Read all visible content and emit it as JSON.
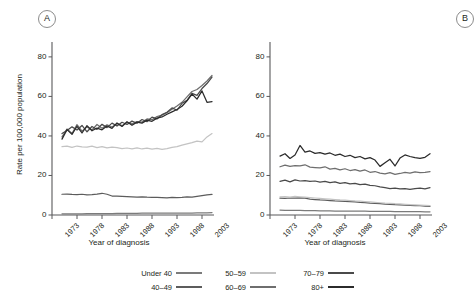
{
  "figure": {
    "panels": [
      {
        "tag": "A",
        "name": "panel-a"
      },
      {
        "tag": "B",
        "name": "panel-b"
      }
    ],
    "axis": {
      "ylabel": "Rate per 100,000 population",
      "xlabel": "Year of diagnosis",
      "yticks": [
        0,
        20,
        40,
        60,
        80
      ],
      "xticks": [
        1973,
        1978,
        1983,
        1988,
        1993,
        1998,
        2003
      ]
    }
  },
  "legend": {
    "entries": [
      {
        "label": "Under 40",
        "color": "#7b7b7b"
      },
      {
        "label": "40–49",
        "color": "#5c5c5c"
      },
      {
        "label": "50–59",
        "color": "#c3c3c3"
      },
      {
        "label": "60–69",
        "color": "#6e6e6e"
      },
      {
        "label": "70–79",
        "color": "#4a4a4a"
      },
      {
        "label": "80+",
        "color": "#2b2b2b"
      }
    ]
  },
  "chart_data": {
    "type": "line",
    "title": "",
    "xlabel": "Year of diagnosis",
    "ylabel": "Rate per 100,000 population",
    "xlim": [
      1973,
      2005
    ],
    "ylim": [
      0,
      85
    ],
    "yticks": [
      0,
      20,
      40,
      60,
      80
    ],
    "xticks": [
      1973,
      1978,
      1983,
      1988,
      1993,
      1998,
      2003
    ],
    "grid": false,
    "legend_position": "bottom",
    "panels": [
      {
        "tag": "A",
        "x": [
          1975,
          1976,
          1977,
          1978,
          1979,
          1980,
          1981,
          1982,
          1983,
          1984,
          1985,
          1986,
          1987,
          1988,
          1989,
          1990,
          1991,
          1992,
          1993,
          1994,
          1995,
          1996,
          1997,
          1998,
          1999,
          2000,
          2001,
          2002,
          2003,
          2004,
          2005
        ],
        "series": [
          {
            "name": "Under 40",
            "color": "#7b7b7b",
            "values": [
              0.6,
              0.6,
              0.6,
              0.6,
              0.6,
              0.7,
              0.7,
              0.7,
              0.7,
              0.7,
              0.7,
              0.8,
              0.8,
              0.8,
              0.8,
              0.8,
              0.9,
              0.9,
              0.9,
              0.9,
              0.9,
              1.0,
              1.0,
              1.0,
              1.0,
              1.0,
              1.0,
              1.1,
              1.1,
              1.1,
              1.2
            ]
          },
          {
            "name": "40–49",
            "color": "#5c5c5c",
            "values": [
              10.5,
              10.6,
              10.4,
              10.3,
              10.5,
              10.2,
              10.3,
              10.6,
              11.0,
              10.5,
              9.6,
              9.5,
              9.4,
              9.3,
              9.2,
              9.1,
              9.2,
              9.0,
              8.9,
              8.9,
              8.8,
              8.7,
              8.9,
              8.8,
              8.9,
              9.2,
              9.0,
              9.4,
              9.8,
              10.2,
              10.4
            ]
          },
          {
            "name": "50–59",
            "color": "#c3c3c3",
            "values": [
              34.6,
              34.8,
              34.2,
              34.9,
              34.5,
              34.3,
              34.8,
              34.1,
              34.6,
              34.0,
              34.4,
              34.1,
              33.6,
              33.9,
              33.5,
              34.0,
              33.4,
              33.8,
              33.3,
              33.7,
              33.2,
              33.6,
              34.2,
              34.6,
              35.4,
              36.0,
              36.6,
              37.4,
              37.0,
              39.5,
              41.2
            ]
          },
          {
            "name": "60–69",
            "color": "#6e6e6e",
            "values": [
              39.5,
              43.5,
              41.2,
              45.7,
              42.4,
              44.6,
              43.0,
              45.8,
              43.9,
              45.6,
              44.5,
              46.2,
              45.2,
              46.8,
              46.1,
              47.3,
              47.0,
              48.6,
              48.2,
              49.8,
              50.5,
              51.8,
              53.5,
              55.2,
              57.0,
              59.8,
              62.5,
              63.5,
              65.5,
              67.8,
              70.6
            ]
          },
          {
            "name": "70–79",
            "color": "#4a4a4a",
            "values": [
              41.2,
              42.8,
              44.6,
              43.0,
              45.3,
              42.1,
              44.8,
              43.3,
              45.9,
              44.2,
              46.5,
              45.0,
              46.9,
              45.8,
              47.5,
              46.4,
              48.3,
              47.2,
              49.5,
              48.6,
              50.8,
              52.0,
              54.2,
              53.0,
              56.5,
              58.0,
              61.5,
              60.5,
              64.0,
              66.5,
              69.8
            ]
          },
          {
            "name": "80+",
            "color": "#2b2b2b",
            "values": [
              38.4,
              43.2,
              40.8,
              44.9,
              41.5,
              45.2,
              42.6,
              44.0,
              43.1,
              45.0,
              43.8,
              46.6,
              44.8,
              47.2,
              45.4,
              47.0,
              46.5,
              48.0,
              47.4,
              49.0,
              49.6,
              51.0,
              52.2,
              53.4,
              55.0,
              57.8,
              61.2,
              58.6,
              62.8,
              57.0,
              57.4
            ]
          }
        ]
      },
      {
        "tag": "B",
        "x": [
          1975,
          1976,
          1977,
          1978,
          1979,
          1980,
          1981,
          1982,
          1983,
          1984,
          1985,
          1986,
          1987,
          1988,
          1989,
          1990,
          1991,
          1992,
          1993,
          1994,
          1995,
          1996,
          1997,
          1998,
          1999,
          2000,
          2001,
          2002,
          2003,
          2004,
          2005
        ],
        "series": [
          {
            "name": "Under 40",
            "color": "#7b7b7b",
            "values": [
              2.5,
              2.4,
              2.4,
              2.3,
              2.3,
              2.2,
              2.2,
              2.2,
              2.1,
              2.1,
              2.1,
              2.0,
              2.0,
              2.0,
              1.9,
              1.9,
              1.9,
              1.9,
              1.8,
              1.8,
              1.8,
              1.8,
              1.8,
              1.7,
              1.7,
              1.7,
              1.7,
              1.7,
              1.7,
              1.6,
              1.6
            ]
          },
          {
            "name": "40–49",
            "color": "#5c5c5c",
            "values": [
              8.5,
              8.4,
              8.6,
              8.5,
              8.7,
              8.5,
              8.0,
              7.8,
              7.6,
              7.5,
              7.3,
              7.1,
              7.0,
              6.9,
              6.8,
              6.6,
              6.4,
              6.3,
              6.0,
              5.9,
              5.7,
              5.5,
              5.4,
              5.2,
              5.1,
              5.0,
              4.9,
              4.8,
              4.7,
              4.5,
              4.4
            ]
          },
          {
            "name": "50–59",
            "color": "#c3c3c3",
            "values": [
              9.2,
              9.3,
              9.1,
              9.4,
              9.2,
              9.0,
              8.8,
              8.6,
              8.4,
              8.2,
              8.0,
              7.8,
              7.6,
              7.5,
              7.3,
              7.1,
              7.0,
              6.8,
              6.6,
              6.4,
              6.2,
              6.0,
              5.9,
              5.7,
              5.6,
              5.4,
              5.2,
              5.1,
              5.0,
              4.9,
              4.8
            ]
          },
          {
            "name": "60–69",
            "color": "#6e6e6e",
            "values": [
              24.4,
              25.2,
              24.6,
              25.0,
              24.8,
              25.4,
              24.2,
              24.0,
              23.8,
              24.4,
              23.2,
              23.6,
              22.8,
              23.4,
              22.5,
              23.0,
              22.2,
              22.8,
              21.6,
              22.0,
              21.2,
              20.8,
              21.4,
              20.6,
              21.0,
              21.6,
              21.2,
              21.8,
              21.4,
              21.6,
              22.0
            ]
          },
          {
            "name": "70–79",
            "color": "#4a4a4a",
            "values": [
              17.0,
              17.6,
              16.8,
              17.8,
              17.2,
              17.4,
              17.0,
              17.2,
              16.6,
              17.0,
              16.4,
              16.8,
              16.0,
              16.4,
              15.8,
              16.0,
              15.4,
              15.6,
              15.0,
              14.8,
              14.2,
              13.8,
              13.4,
              13.6,
              13.2,
              13.4,
              13.0,
              13.4,
              13.6,
              13.2,
              13.8
            ]
          },
          {
            "name": "80+",
            "color": "#2b2b2b",
            "values": [
              29.8,
              31.0,
              28.6,
              30.4,
              35.2,
              31.8,
              32.4,
              31.2,
              31.6,
              30.8,
              31.4,
              30.2,
              30.8,
              29.6,
              30.2,
              29.0,
              29.6,
              28.4,
              29.0,
              27.8,
              24.6,
              26.4,
              28.2,
              24.8,
              28.8,
              30.4,
              29.6,
              29.0,
              28.6,
              29.2,
              31.0
            ]
          }
        ]
      }
    ]
  }
}
